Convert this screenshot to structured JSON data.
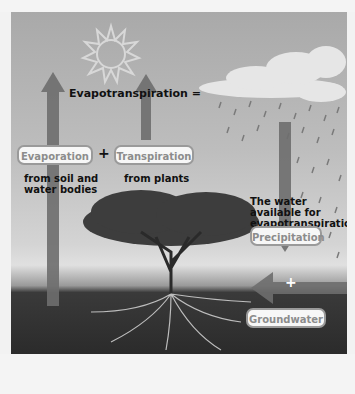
{
  "diagram": {
    "title": "Evapotranspiration =",
    "left_terms": [
      {
        "label": "Evaporation",
        "caption": "from soil and water bodies",
        "caption_lines": [
          "from soil and",
          "water bodies"
        ]
      },
      {
        "label": "Transpiration",
        "caption": "from plants"
      }
    ],
    "left_operator": "+",
    "right_heading": "The water available for evapotranspiration =",
    "right_heading_lines": [
      "The water available for",
      "evapotranspiration ="
    ],
    "right_terms": [
      {
        "label": "Precipitation"
      },
      {
        "label": "Groundwater"
      }
    ],
    "right_operator": "+",
    "illustration": {
      "elements": [
        "sun-icon",
        "cloud",
        "rain",
        "tree",
        "roots",
        "soil"
      ],
      "palette": {
        "arrow": "#6e6e6e",
        "sky_top": "#a9a9a9",
        "sky_bottom": "#d4d4d4",
        "soil": "#2b2b2b",
        "pill_bg": "#f7f7f7",
        "pill_border": "#9a9a9a",
        "pill_text": "#8c8c8c"
      }
    }
  }
}
